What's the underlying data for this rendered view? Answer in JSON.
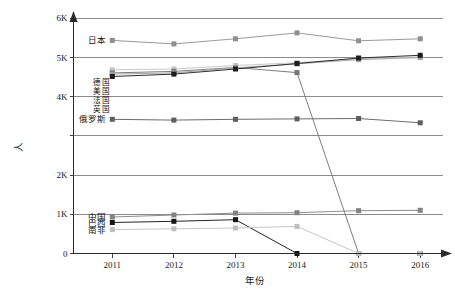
{
  "chart_data": {
    "type": "line",
    "title": "",
    "xlabel": "年份",
    "ylabel": "人",
    "grid": true,
    "legend_position": "inline-left",
    "x": [
      "2011",
      "2012",
      "2013",
      "2014",
      "2015",
      "2016"
    ],
    "categories": [
      "2011",
      "2012",
      "2013",
      "2014",
      "2015",
      "2016"
    ],
    "ylim": [
      0,
      6000
    ],
    "ytick_labels": [
      "0",
      "1K",
      "2K",
      "3K",
      "4K",
      "5K",
      "6K"
    ],
    "ytick_values": [
      0,
      1000,
      2000,
      3000,
      4000,
      5000,
      6000
    ],
    "series": [
      {
        "name": "日本",
        "color": "#9a9a9a",
        "marker_color": "#8f8f8f",
        "label_x": 2011,
        "values": [
          5430,
          5340,
          5470,
          5620,
          5420,
          5470
        ]
      },
      {
        "name": "德国",
        "color": "#c9c9c9",
        "marker_color": "#c4c4c4",
        "label_x": 2011,
        "values": [
          4680,
          4700,
          4790,
          4860,
          4960,
          5010
        ]
      },
      {
        "name": "美国",
        "color": "#7d7d7d",
        "marker_color": "#757575",
        "label_x": 2011,
        "values": [
          4600,
          4640,
          4740,
          4610,
          0,
          0
        ]
      },
      {
        "name": "法国",
        "color": "#a8a8a8",
        "marker_color": "#a0a0a0",
        "label_x": 2011,
        "values": [
          4570,
          4600,
          4730,
          4830,
          4940,
          4990
        ]
      },
      {
        "name": "英国",
        "color": "#2e2e2e",
        "marker_color": "#1d1d1d",
        "label_x": 2011,
        "values": [
          4510,
          4570,
          4700,
          4840,
          4980,
          5050
        ]
      },
      {
        "name": "俄罗斯",
        "color": "#6b6b6b",
        "marker_color": "#5e5e5e",
        "label_x": 2011,
        "values": [
          3420,
          3400,
          3420,
          3430,
          3440,
          3330
        ]
      },
      {
        "name": "中国",
        "color": "#8d8d8d",
        "marker_color": "#828282",
        "label_x": 2011,
        "values": [
          930,
          980,
          1030,
          1040,
          1090,
          1100
        ]
      },
      {
        "name": "巴西",
        "color": "#242424",
        "marker_color": "#141414",
        "label_x": 2011,
        "values": [
          790,
          820,
          860,
          0,
          0,
          0
        ]
      },
      {
        "name": "南非",
        "color": "#c6c6c6",
        "marker_color": "#bfbfbf",
        "label_x": 2011,
        "values": [
          610,
          630,
          650,
          690,
          0,
          0
        ]
      }
    ],
    "stacked_label_groups": [
      {
        "lines": [
          "德国",
          "美国",
          "法国",
          "英国"
        ],
        "position": "left-of-4600"
      }
    ]
  },
  "colors": {
    "axis": "#2b2b2b",
    "grid": "#6e6e6e",
    "background": "#ffffff",
    "text": "#1a1a1a"
  }
}
